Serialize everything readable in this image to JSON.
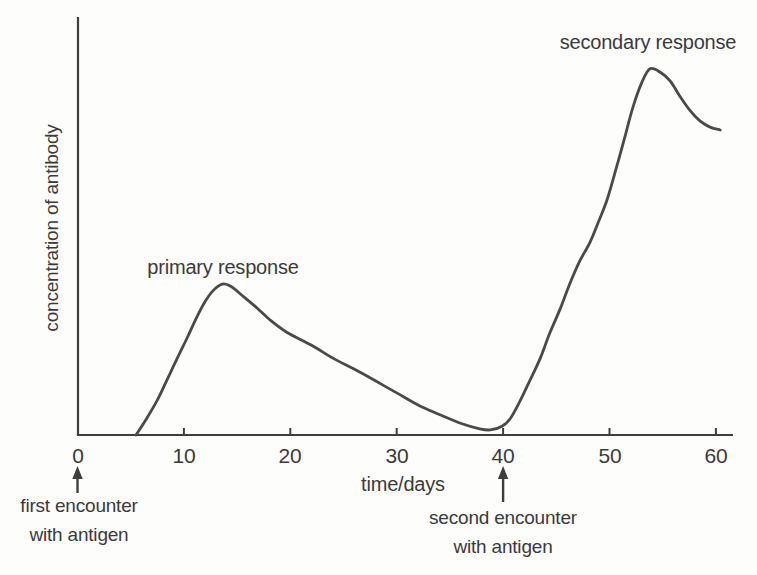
{
  "figure_title": "antibody concentration: primary and secondary immune response",
  "chart_data": {
    "type": "line",
    "title": "",
    "xlabel": "time/days",
    "ylabel": "concentration of antibody",
    "x_ticks": [
      0,
      10,
      20,
      30,
      40,
      50,
      60
    ],
    "xlim": [
      0,
      61.5
    ],
    "ylim": [
      0,
      114
    ],
    "y_axis_unlabeled": "relative units, no y ticks",
    "grid": false,
    "legend": "none",
    "curve_color": "#4a4a4a",
    "axis_color": "#3e3e3e",
    "text_color": "#3a3a3a",
    "series": [
      {
        "name": "antibody concentration",
        "points": [
          [
            5.5,
            0
          ],
          [
            6.5,
            4.5
          ],
          [
            7.5,
            9.5
          ],
          [
            8.4,
            15
          ],
          [
            9.3,
            20.5
          ],
          [
            10.3,
            26.5
          ],
          [
            11.1,
            31.5
          ],
          [
            11.9,
            36
          ],
          [
            12.7,
            39.3
          ],
          [
            13.6,
            41.2
          ],
          [
            14.4,
            40.6
          ],
          [
            15.6,
            37.8
          ],
          [
            16.9,
            34.6
          ],
          [
            18.1,
            31.4
          ],
          [
            19.7,
            28
          ],
          [
            22,
            24.5
          ],
          [
            24,
            21
          ],
          [
            26,
            18
          ],
          [
            28,
            14.8
          ],
          [
            30,
            11.5
          ],
          [
            32,
            8.2
          ],
          [
            34,
            5.6
          ],
          [
            36,
            3.2
          ],
          [
            37.8,
            1.7
          ],
          [
            38.8,
            1.4
          ],
          [
            39.9,
            2.4
          ],
          [
            40.7,
            4.6
          ],
          [
            41.6,
            9.3
          ],
          [
            42.5,
            14.8
          ],
          [
            43.5,
            21
          ],
          [
            44.4,
            27.9
          ],
          [
            45.4,
            34.7
          ],
          [
            46.3,
            41.5
          ],
          [
            47.2,
            47.5
          ],
          [
            48.2,
            52.8
          ],
          [
            49,
            58.5
          ],
          [
            49.8,
            64.5
          ],
          [
            50.7,
            73.5
          ],
          [
            51.5,
            82
          ],
          [
            52.2,
            89.5
          ],
          [
            53,
            96
          ],
          [
            53.8,
            100
          ],
          [
            54.8,
            99
          ],
          [
            55.7,
            96.7
          ],
          [
            56.6,
            92.6
          ],
          [
            57.6,
            88.5
          ],
          [
            58.5,
            85.8
          ],
          [
            59.5,
            84
          ],
          [
            60.4,
            83.3
          ]
        ]
      }
    ],
    "annotations": [
      {
        "id": "primary",
        "text": "primary response",
        "x_day": 13.6,
        "placement": "above primary peak"
      },
      {
        "id": "secondary",
        "text": "secondary response",
        "x_day": 53.8,
        "placement": "above secondary peak"
      },
      {
        "id": "first-encounter",
        "lines": [
          "first encounter",
          "with antigen"
        ],
        "x_day": 0,
        "arrow": true,
        "placement": "below x-axis, arrow points up at day 0"
      },
      {
        "id": "second-encounter",
        "lines": [
          "second encounter",
          "with antigen"
        ],
        "x_day": 40,
        "arrow": true,
        "placement": "below x-axis, arrow points up at day 40"
      }
    ]
  }
}
